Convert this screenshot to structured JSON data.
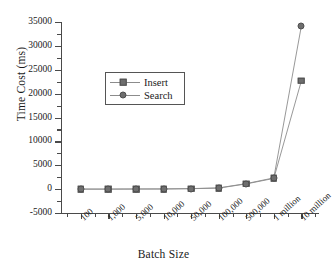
{
  "chart_data": {
    "type": "line",
    "title": "",
    "xlabel": "Batch Size",
    "ylabel": "Time Cost (ms)",
    "categories": [
      "100",
      "1,000",
      "5,000",
      "10,000",
      "50,000",
      "100,000",
      "500,000",
      "1 million",
      "10 million"
    ],
    "series": [
      {
        "name": "Insert",
        "marker": "square",
        "color": "#6e6e6e",
        "values": [
          5,
          10,
          20,
          35,
          90,
          210,
          1100,
          2250,
          22700
        ]
      },
      {
        "name": "Search",
        "marker": "circle",
        "color": "#6e6e6e",
        "values": [
          5,
          12,
          25,
          40,
          110,
          260,
          1150,
          2350,
          34200
        ]
      }
    ],
    "ylim": [
      -5000,
      35000
    ],
    "yticks": [
      -5000,
      0,
      5000,
      10000,
      15000,
      20000,
      25000,
      30000,
      35000
    ],
    "ytick_labels": [
      "-5000",
      "0",
      "5000",
      "10000",
      "15000",
      "20000",
      "25000",
      "30000",
      "35000"
    ],
    "grid": false,
    "legend_position": "upper-left-inside",
    "line_color": "#8c8c8c",
    "axis_color": "#4a4a4a"
  }
}
